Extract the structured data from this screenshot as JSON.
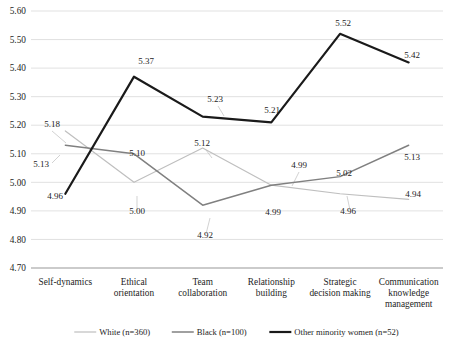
{
  "chart_data": {
    "type": "line",
    "title": "",
    "subtitle": "",
    "xlabel": "",
    "ylabel": "",
    "ylim": [
      4.7,
      5.6
    ],
    "ytick_step": 0.1,
    "grid": true,
    "legend_position": "bottom",
    "categories": [
      "Self-dynamics",
      "Ethical orientation",
      "Team collaboration",
      "Relationship building",
      "Strategic decision making",
      "Communication knowledge management"
    ],
    "category_lines": [
      [
        "Self-dynamics"
      ],
      [
        "Ethical",
        "orientation"
      ],
      [
        "Team",
        "collaboration"
      ],
      [
        "Relationship",
        "building"
      ],
      [
        "Strategic",
        "decision making"
      ],
      [
        "Communication",
        "knowledge",
        "management"
      ]
    ],
    "ytick_labels": [
      "5.60",
      "5.50",
      "5.40",
      "5.30",
      "5.20",
      "5.10",
      "5.00",
      "4.90",
      "4.80",
      "4.70"
    ],
    "ytick_values": [
      5.6,
      5.5,
      5.4,
      5.3,
      5.2,
      5.1,
      5.0,
      4.9,
      4.8,
      4.7
    ],
    "series": [
      {
        "name": "White (n=360)",
        "color": "#bfbfbf",
        "width": 1.2,
        "values": [
          5.18,
          5.0,
          5.12,
          4.99,
          4.96,
          4.94
        ],
        "labels": [
          "5.18",
          "5.00",
          "5.12",
          "4.99",
          "4.96",
          "4.94"
        ]
      },
      {
        "name": "Black (n=100)",
        "color": "#808080",
        "width": 1.5,
        "values": [
          5.13,
          5.1,
          4.92,
          4.99,
          5.02,
          5.13
        ],
        "labels": [
          "5.13",
          "5.10",
          "4.92",
          "4.99",
          "5.02",
          "5.13"
        ]
      },
      {
        "name": "Other minority women (n=52)",
        "color": "#1a1a1a",
        "width": 2.2,
        "values": [
          4.96,
          5.37,
          5.23,
          5.21,
          5.52,
          5.42
        ],
        "labels": [
          "4.96",
          "5.37",
          "5.23",
          "5.21",
          "5.52",
          "5.42"
        ]
      }
    ],
    "legend": [
      {
        "label": "White (n=360)",
        "color": "#bfbfbf",
        "width": 1.2
      },
      {
        "label": "Black (n=100)",
        "color": "#808080",
        "width": 1.5
      },
      {
        "label": "Other minority women (n=52)",
        "color": "#1a1a1a",
        "width": 2.2
      }
    ],
    "point_labels": [
      {
        "text": "5.18",
        "x": 52,
        "y": 127,
        "anchor": "middle",
        "leader": null
      },
      {
        "text": "5.13",
        "x": 41,
        "y": 167,
        "anchor": "middle",
        "leader": null
      },
      {
        "text": "4.96",
        "x": 55,
        "y": 199,
        "anchor": "middle",
        "leader": null
      },
      {
        "text": "5.37",
        "x": 146,
        "y": 64,
        "anchor": "middle",
        "leader": null
      },
      {
        "text": "5.10",
        "x": 137,
        "y": 156,
        "anchor": "middle",
        "leader": null
      },
      {
        "text": "5.00",
        "x": 137,
        "y": 214,
        "anchor": "middle",
        "leader": null
      },
      {
        "text": "5.23",
        "x": 215,
        "y": 102,
        "anchor": "middle",
        "leader": null
      },
      {
        "text": "5.12",
        "x": 202,
        "y": 146,
        "anchor": "middle",
        "leader": null
      },
      {
        "text": "4.92",
        "x": 205,
        "y": 238,
        "anchor": "middle",
        "leader": null
      },
      {
        "text": "5.21",
        "x": 272,
        "y": 113,
        "anchor": "middle",
        "leader": null
      },
      {
        "text": "4.99",
        "x": 299,
        "y": 168,
        "anchor": "middle",
        "leader": null
      },
      {
        "text": "4.99",
        "x": 273,
        "y": 215,
        "anchor": "middle",
        "leader": null
      },
      {
        "text": "5.52",
        "x": 343,
        "y": 26,
        "anchor": "middle",
        "leader": null
      },
      {
        "text": "5.02",
        "x": 344,
        "y": 176,
        "anchor": "middle",
        "leader": null
      },
      {
        "text": "4.96",
        "x": 348,
        "y": 214,
        "anchor": "middle",
        "leader": null
      },
      {
        "text": "5.42",
        "x": 412,
        "y": 58,
        "anchor": "middle",
        "leader": null
      },
      {
        "text": "5.13",
        "x": 412,
        "y": 160,
        "anchor": "middle",
        "leader": null
      },
      {
        "text": "4.94",
        "x": 413,
        "y": 197,
        "anchor": "middle",
        "leader": null
      }
    ]
  }
}
